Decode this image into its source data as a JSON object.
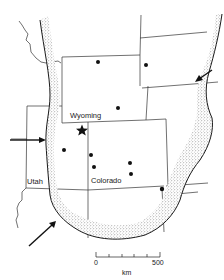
{
  "figure": {
    "type": "map",
    "style": "black-and-white line map with stippled boundary band",
    "colors": {
      "ink": "#1a1a1a",
      "background": "#ffffff",
      "stipple": "#555555"
    }
  },
  "labels": {
    "wyoming": "Wyoming",
    "utah": "Utah",
    "colorado": "Colorado"
  },
  "markers": {
    "star": {
      "x": 82,
      "y": 130,
      "symbol": "star"
    },
    "dots": [
      {
        "x": 98,
        "y": 62
      },
      {
        "x": 146,
        "y": 65
      },
      {
        "x": 118,
        "y": 108
      },
      {
        "x": 64,
        "y": 150
      },
      {
        "x": 91,
        "y": 155
      },
      {
        "x": 130,
        "y": 163
      },
      {
        "x": 94,
        "y": 167
      },
      {
        "x": 131,
        "y": 174
      },
      {
        "x": 162,
        "y": 189
      }
    ]
  },
  "arrows": [
    {
      "name": "west-arrow",
      "from": [
        10,
        140
      ],
      "to": [
        46,
        140
      ]
    },
    {
      "name": "northeast-arrow",
      "from": [
        212,
        70
      ],
      "to": [
        196,
        81
      ]
    },
    {
      "name": "southwest-arrow",
      "from": [
        29,
        246
      ],
      "to": [
        55,
        222
      ]
    }
  ],
  "scale_bar": {
    "start_label": "0",
    "end_label": "500",
    "unit": "km",
    "ticks": 6
  }
}
